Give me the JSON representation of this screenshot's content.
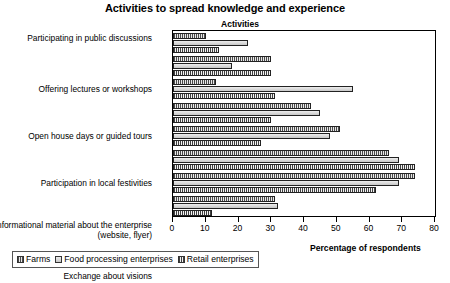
{
  "chart_data": {
    "type": "bar",
    "orientation": "horizontal",
    "title": "Activities to spread knowledge and experience",
    "group_axis_title": "Activities",
    "xlabel": "Percentage of respondents",
    "ylabel": "",
    "xlim": [
      0,
      80
    ],
    "xticks": [
      0,
      10,
      20,
      30,
      40,
      50,
      60,
      70,
      80
    ],
    "grid": false,
    "legend_position": "bottom-left",
    "categories": [
      "Participating in public discussions",
      "Offering lectures or workshops",
      "Open house days or guided tours",
      "Participation in local festivities",
      "Informational material about the enterprise (website, flyer)",
      "Exchange about visions",
      "Participation of the employees in training measures",
      "Training young people"
    ],
    "series": [
      {
        "name": "Farms",
        "values": [
          10,
          30,
          13,
          42,
          51,
          66,
          74,
          31
        ]
      },
      {
        "name": "Food processing enterprises",
        "values": [
          23,
          18,
          55,
          45,
          48,
          69,
          69,
          32
        ]
      },
      {
        "name": "Retail enterprises",
        "values": [
          14,
          30,
          31,
          30,
          27,
          74,
          62,
          12
        ]
      }
    ]
  },
  "legend": {
    "items": [
      {
        "label": "Farms",
        "swatch": "series-0-swatch"
      },
      {
        "label": "Food processing enterprises",
        "swatch": "series-1-swatch"
      },
      {
        "label": "Retail enterprises",
        "swatch": "series-2-swatch"
      }
    ]
  },
  "colors": {
    "series_0": "#b0b0b0",
    "series_1": "#d8d8d8",
    "series_2": "#bdbdbd",
    "axis": "#000000",
    "text": "#000000"
  }
}
